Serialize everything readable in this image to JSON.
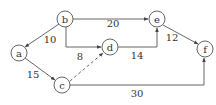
{
  "diagram": {
    "type": "directed-weighted-graph",
    "nodes": [
      {
        "id": "a",
        "label": "a",
        "x": 19,
        "y": 53
      },
      {
        "id": "b",
        "label": "b",
        "x": 65,
        "y": 19
      },
      {
        "id": "c",
        "label": "c",
        "x": 62,
        "y": 85
      },
      {
        "id": "d",
        "label": "d",
        "x": 110,
        "y": 47
      },
      {
        "id": "e",
        "label": "e",
        "x": 157,
        "y": 19
      },
      {
        "id": "f",
        "label": "f",
        "x": 205,
        "y": 49
      }
    ],
    "edges": [
      {
        "from": "b",
        "to": "a",
        "weight": "10",
        "style": "solid"
      },
      {
        "from": "b",
        "to": "e",
        "weight": "20",
        "style": "solid"
      },
      {
        "from": "b",
        "to": "d",
        "weight": "8",
        "style": "solid"
      },
      {
        "from": "a",
        "to": "c",
        "weight": "15",
        "style": "solid"
      },
      {
        "from": "c",
        "to": "d",
        "weight": "",
        "style": "dashed"
      },
      {
        "from": "d",
        "to": "e",
        "weight": "14",
        "style": "solid"
      },
      {
        "from": "e",
        "to": "f",
        "weight": "12",
        "style": "solid"
      },
      {
        "from": "c",
        "to": "f",
        "weight": "30",
        "style": "solid"
      }
    ]
  }
}
